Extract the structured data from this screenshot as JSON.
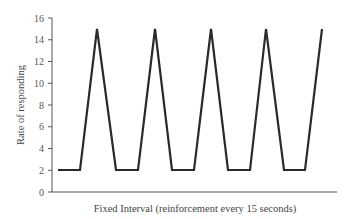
{
  "chart_data": {
    "type": "line",
    "title": "",
    "xlabel": "Fixed Interval (reinforcement every 15 seconds)",
    "ylabel": "Rate of responding",
    "ylim": [
      0,
      16
    ],
    "yticks": [
      0,
      2,
      4,
      6,
      8,
      10,
      12,
      14,
      16
    ],
    "grid": false,
    "legend": null,
    "series": [
      {
        "name": "Fixed Interval responding",
        "color": "#2a2a2a",
        "points": [
          {
            "x": 0.0,
            "y": 2
          },
          {
            "x": 0.4,
            "y": 2
          },
          {
            "x": 1.0,
            "y": 15
          },
          {
            "x": 1.6,
            "y": 2
          },
          {
            "x": 2.0,
            "y": 2
          },
          {
            "x": 2.6,
            "y": 15
          },
          {
            "x": 3.2,
            "y": 2
          },
          {
            "x": 3.6,
            "y": 2
          },
          {
            "x": 4.2,
            "y": 15
          },
          {
            "x": 4.8,
            "y": 2
          },
          {
            "x": 5.2,
            "y": 2
          },
          {
            "x": 5.8,
            "y": 15
          },
          {
            "x": 6.4,
            "y": 2
          },
          {
            "x": 6.8,
            "y": 2
          },
          {
            "x": 7.4,
            "y": 15
          }
        ]
      }
    ]
  },
  "layout": {
    "pixel_points": [
      [
        58,
        170
      ],
      [
        80,
        170
      ],
      [
        97,
        29
      ],
      [
        116,
        170
      ],
      [
        138,
        170
      ],
      [
        155,
        29
      ],
      [
        172,
        170
      ],
      [
        194,
        170
      ],
      [
        211,
        29
      ],
      [
        228,
        170
      ],
      [
        250,
        170
      ],
      [
        266,
        29
      ],
      [
        284,
        170
      ],
      [
        305,
        170
      ],
      [
        322,
        29
      ]
    ],
    "axis": {
      "x0": 52,
      "x1": 337,
      "y0": 192,
      "y_top": 18
    },
    "axis_color": "#555555"
  }
}
